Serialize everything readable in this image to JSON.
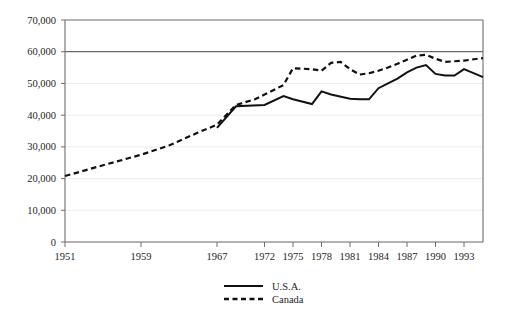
{
  "chart_data": {
    "type": "line",
    "title": "",
    "subtitle": "",
    "xlabel": "",
    "ylabel": "",
    "ylim": [
      0,
      70000
    ],
    "xlim": [
      1951,
      1995
    ],
    "grid": true,
    "legend_position": "bottom-center",
    "y_ticks": [
      0,
      10000,
      20000,
      30000,
      40000,
      50000,
      60000,
      70000
    ],
    "y_tick_labels": [
      "0",
      "10,000",
      "20,000",
      "30,000",
      "40,000",
      "50,000",
      "60,000",
      "70,000"
    ],
    "x_ticks": [
      1951,
      1959,
      1967,
      1972,
      1975,
      1978,
      1981,
      1984,
      1987,
      1990,
      1993
    ],
    "x_tick_labels": [
      "1951",
      "1959",
      "1967",
      "1972",
      "1975",
      "1978",
      "1981",
      "1984",
      "1987",
      "1990",
      "1993"
    ],
    "series": [
      {
        "name": "U.S.A.",
        "style": "solid",
        "color": "#111111",
        "x": [
          1967,
          1969,
          1972,
          1974,
          1975,
          1977,
          1978,
          1979,
          1981,
          1982,
          1983,
          1984,
          1985,
          1986,
          1987,
          1988,
          1989,
          1990,
          1991,
          1992,
          1993,
          1995
        ],
        "values": [
          36000,
          42800,
          43200,
          46000,
          45000,
          43500,
          47500,
          46500,
          45200,
          45000,
          45000,
          48500,
          50000,
          51500,
          53500,
          55000,
          55800,
          53000,
          52500,
          52500,
          54500,
          52000
        ]
      },
      {
        "name": "Canada",
        "style": "dashed",
        "color": "#111111",
        "x": [
          1951,
          1955,
          1959,
          1962,
          1965,
          1967,
          1969,
          1971,
          1972,
          1974,
          1975,
          1977,
          1978,
          1979,
          1980,
          1981,
          1982,
          1983,
          1984,
          1985,
          1986,
          1987,
          1988,
          1989,
          1990,
          1991,
          1992,
          1993,
          1995
        ],
        "values": [
          20800,
          24200,
          27500,
          30500,
          34500,
          37000,
          43200,
          45000,
          46500,
          49500,
          54800,
          54500,
          54000,
          56500,
          56800,
          54500,
          52800,
          53200,
          54000,
          55000,
          56200,
          57500,
          58800,
          59000,
          57800,
          56800,
          57000,
          57200,
          58000
        ]
      }
    ]
  },
  "legend": {
    "items": [
      {
        "label": "U.S.A.",
        "style": "solid"
      },
      {
        "label": "Canada",
        "style": "dashed"
      }
    ]
  }
}
